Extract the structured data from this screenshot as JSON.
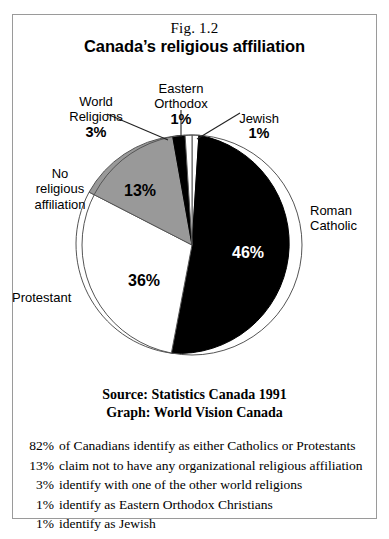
{
  "figure": {
    "number": "Fig. 1.2",
    "title": "Canada’s religious affiliation"
  },
  "source_block": {
    "source_line": "Source: Statistics Canada 1991",
    "graph_line": "Graph: World Vision Canada"
  },
  "callouts": {
    "world_religions": {
      "name": "World\nReligions",
      "pct": "3%"
    },
    "eastern_orthodox": {
      "name": "Eastern\nOrthodox",
      "pct": "1%"
    },
    "jewish": {
      "name": "Jewish",
      "pct": "1%"
    },
    "no_religious": {
      "name": "No\nreligious\naffiliation",
      "pct": ""
    },
    "protestant": {
      "name": "Protestant",
      "pct": ""
    },
    "roman_catholic": {
      "name": "Roman\nCatholic",
      "pct": ""
    }
  },
  "slice_values": {
    "roman_catholic": "46%",
    "protestant": "36%",
    "no_religious": "13%"
  },
  "footnotes": [
    {
      "pct": "82%",
      "text": "of Canadians identify as either Catholics or Protestants"
    },
    {
      "pct": "13%",
      "text": "claim not to have any organizational religious affiliation"
    },
    {
      "pct": "3%",
      "text": "identify with one of the other world religions"
    },
    {
      "pct": "1%",
      "text": "identify as Eastern Orthodox Christians"
    },
    {
      "pct": "1%",
      "text": "identify as Jewish"
    }
  ],
  "colors": {
    "black_slice": "#000000",
    "white_slice": "#ffffff",
    "grey_slice": "#999999",
    "outline": "#555555",
    "frame": "#9a9a9a"
  },
  "chart_data": {
    "type": "pie",
    "title": "Canada’s religious affiliation",
    "subtitle": "Fig. 1.2",
    "categories": [
      "Jewish",
      "Roman Catholic",
      "Protestant",
      "No religious affiliation",
      "World Religions",
      "Eastern Orthodox"
    ],
    "values": [
      1,
      46,
      36,
      13,
      3,
      1
    ],
    "labels": [
      "1%",
      "46%",
      "36%",
      "13%",
      "3%",
      "1%"
    ],
    "slice_fills": [
      "#ffffff",
      "#000000",
      "#ffffff",
      "#999999",
      "#000000",
      "#ffffff"
    ],
    "start_angle_deg": 0,
    "direction": "clockwise",
    "legend": "none",
    "grid": false,
    "annotations": [
      "Source: Statistics Canada 1991",
      "Graph: World Vision Canada",
      "82% of Canadians identify as either Catholics or Protestants",
      "13% claim not to have any organizational religious affiliation",
      "3% identify with one of the other world religions",
      "1% identify as Eastern Orthodox Christians",
      "1% identify as Jewish"
    ]
  }
}
